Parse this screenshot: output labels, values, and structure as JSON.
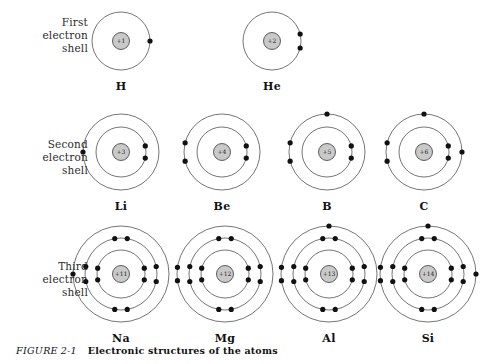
{
  "figure": {
    "caption_prefix": "FIGURE",
    "caption_number": "2-1",
    "caption_text": "Electronic structures of the atoms"
  },
  "style": {
    "nucleus_fill": "#c9c9c9",
    "nucleus_stroke": "#3a3a3a",
    "shell_stroke": "#3a3a3a",
    "electron_fill": "#111111",
    "background": "#ffffff"
  },
  "rows": [
    {
      "id": "row-1",
      "label": "First\nelectron\nshell",
      "label_lines": [
        "First",
        "electron",
        "shell"
      ],
      "atoms": [
        {
          "symbol": "H",
          "nucleus": "+1",
          "cx": 121,
          "cy": 41,
          "shell_radii": [
            29
          ],
          "electrons": [
            {
              "shell": 0,
              "angle": 0,
              "offset": 0
            }
          ]
        },
        {
          "symbol": "He",
          "nucleus": "+2",
          "cx": 272,
          "cy": 41,
          "shell_radii": [
            29
          ],
          "electrons": [
            {
              "shell": 0,
              "angle": -14,
              "offset": 0
            },
            {
              "shell": 0,
              "angle": 14,
              "offset": 0
            }
          ]
        }
      ]
    },
    {
      "id": "row-2",
      "label_lines": [
        "Second",
        "electron",
        "shell"
      ],
      "atoms": [
        {
          "symbol": "Li",
          "nucleus": "+3",
          "cx": 121,
          "cy": 52,
          "shell_radii": [
            25,
            38
          ],
          "electrons": [
            {
              "shell": 0,
              "angle": -14,
              "offset": 0
            },
            {
              "shell": 0,
              "angle": 14,
              "offset": 0
            },
            {
              "shell": 1,
              "angle": 180,
              "offset": 0
            }
          ]
        },
        {
          "symbol": "Be",
          "nucleus": "+4",
          "cx": 222,
          "cy": 52,
          "shell_radii": [
            25,
            38
          ],
          "electrons": [
            {
              "shell": 0,
              "angle": -14,
              "offset": 0
            },
            {
              "shell": 0,
              "angle": 14,
              "offset": 0
            },
            {
              "shell": 1,
              "angle": 166,
              "offset": 0
            },
            {
              "shell": 1,
              "angle": 194,
              "offset": 0
            }
          ]
        },
        {
          "symbol": "B",
          "nucleus": "+5",
          "cx": 327,
          "cy": 52,
          "shell_radii": [
            25,
            38
          ],
          "electrons": [
            {
              "shell": 0,
              "angle": -14,
              "offset": 0
            },
            {
              "shell": 0,
              "angle": 14,
              "offset": 0
            },
            {
              "shell": 1,
              "angle": 166,
              "offset": 0
            },
            {
              "shell": 1,
              "angle": 194,
              "offset": 0
            },
            {
              "shell": 1,
              "angle": 270,
              "offset": 0
            }
          ]
        },
        {
          "symbol": "C",
          "nucleus": "+6",
          "cx": 424,
          "cy": 52,
          "shell_radii": [
            25,
            38
          ],
          "electrons": [
            {
              "shell": 0,
              "angle": -14,
              "offset": 0
            },
            {
              "shell": 0,
              "angle": 14,
              "offset": 0
            },
            {
              "shell": 1,
              "angle": 166,
              "offset": 0
            },
            {
              "shell": 1,
              "angle": 194,
              "offset": 0
            },
            {
              "shell": 1,
              "angle": 270,
              "offset": 0
            },
            {
              "shell": 1,
              "angle": 0,
              "offset": 0
            }
          ]
        }
      ]
    },
    {
      "id": "row-3",
      "label_lines": [
        "Third",
        "electron",
        "shell"
      ],
      "atoms": [
        {
          "symbol": "Na",
          "nucleus": "+11",
          "cx": 121,
          "cy": 54,
          "shell_radii": [
            24,
            36,
            48
          ],
          "electrons": [
            {
              "shell": 0,
              "angle": -14,
              "offset": 0
            },
            {
              "shell": 0,
              "angle": 14,
              "offset": 0
            },
            {
              "shell": 0,
              "angle": 166,
              "offset": 0
            },
            {
              "shell": 0,
              "angle": 194,
              "offset": 0
            },
            {
              "shell": 1,
              "angle": -12,
              "offset": 0
            },
            {
              "shell": 1,
              "angle": 12,
              "offset": 0
            },
            {
              "shell": 1,
              "angle": 168,
              "offset": 0
            },
            {
              "shell": 1,
              "angle": 192,
              "offset": 0
            },
            {
              "shell": 1,
              "angle": -100,
              "offset": 0
            },
            {
              "shell": 1,
              "angle": -80,
              "offset": 0
            },
            {
              "shell": 1,
              "angle": 80,
              "offset": 0
            },
            {
              "shell": 1,
              "angle": 100,
              "offset": 0
            },
            {
              "shell": 2,
              "angle": 180,
              "offset": 0
            }
          ]
        },
        {
          "symbol": "Mg",
          "nucleus": "+12",
          "cx": 225,
          "cy": 54,
          "shell_radii": [
            24,
            36,
            48
          ],
          "electrons": [
            {
              "shell": 0,
              "angle": -14,
              "offset": 0
            },
            {
              "shell": 0,
              "angle": 14,
              "offset": 0
            },
            {
              "shell": 0,
              "angle": 166,
              "offset": 0
            },
            {
              "shell": 0,
              "angle": 194,
              "offset": 0
            },
            {
              "shell": 1,
              "angle": -12,
              "offset": 0
            },
            {
              "shell": 1,
              "angle": 12,
              "offset": 0
            },
            {
              "shell": 1,
              "angle": 168,
              "offset": 0
            },
            {
              "shell": 1,
              "angle": 192,
              "offset": 0
            },
            {
              "shell": 1,
              "angle": -100,
              "offset": 0
            },
            {
              "shell": 1,
              "angle": -80,
              "offset": 0
            },
            {
              "shell": 1,
              "angle": 80,
              "offset": 0
            },
            {
              "shell": 1,
              "angle": 100,
              "offset": 0
            },
            {
              "shell": 2,
              "angle": 172,
              "offset": 0
            },
            {
              "shell": 2,
              "angle": 188,
              "offset": 0
            }
          ]
        },
        {
          "symbol": "Al",
          "nucleus": "+13",
          "cx": 329,
          "cy": 54,
          "shell_radii": [
            24,
            36,
            48
          ],
          "electrons": [
            {
              "shell": 0,
              "angle": -14,
              "offset": 0
            },
            {
              "shell": 0,
              "angle": 14,
              "offset": 0
            },
            {
              "shell": 0,
              "angle": 166,
              "offset": 0
            },
            {
              "shell": 0,
              "angle": 194,
              "offset": 0
            },
            {
              "shell": 1,
              "angle": -12,
              "offset": 0
            },
            {
              "shell": 1,
              "angle": 12,
              "offset": 0
            },
            {
              "shell": 1,
              "angle": 168,
              "offset": 0
            },
            {
              "shell": 1,
              "angle": 192,
              "offset": 0
            },
            {
              "shell": 1,
              "angle": -100,
              "offset": 0
            },
            {
              "shell": 1,
              "angle": -80,
              "offset": 0
            },
            {
              "shell": 1,
              "angle": 80,
              "offset": 0
            },
            {
              "shell": 1,
              "angle": 100,
              "offset": 0
            },
            {
              "shell": 2,
              "angle": 172,
              "offset": 0
            },
            {
              "shell": 2,
              "angle": 188,
              "offset": 0
            },
            {
              "shell": 2,
              "angle": 270,
              "offset": 0
            }
          ]
        },
        {
          "symbol": "Si",
          "nucleus": "+14",
          "cx": 428,
          "cy": 54,
          "shell_radii": [
            24,
            36,
            48
          ],
          "electrons": [
            {
              "shell": 0,
              "angle": -14,
              "offset": 0
            },
            {
              "shell": 0,
              "angle": 14,
              "offset": 0
            },
            {
              "shell": 0,
              "angle": 166,
              "offset": 0
            },
            {
              "shell": 0,
              "angle": 194,
              "offset": 0
            },
            {
              "shell": 1,
              "angle": -12,
              "offset": 0
            },
            {
              "shell": 1,
              "angle": 12,
              "offset": 0
            },
            {
              "shell": 1,
              "angle": 168,
              "offset": 0
            },
            {
              "shell": 1,
              "angle": 192,
              "offset": 0
            },
            {
              "shell": 1,
              "angle": -100,
              "offset": 0
            },
            {
              "shell": 1,
              "angle": -80,
              "offset": 0
            },
            {
              "shell": 1,
              "angle": 80,
              "offset": 0
            },
            {
              "shell": 1,
              "angle": 100,
              "offset": 0
            },
            {
              "shell": 2,
              "angle": 172,
              "offset": 0
            },
            {
              "shell": 2,
              "angle": 188,
              "offset": 0
            },
            {
              "shell": 2,
              "angle": 270,
              "offset": 0
            },
            {
              "shell": 2,
              "angle": 0,
              "offset": 0
            }
          ]
        }
      ]
    }
  ]
}
